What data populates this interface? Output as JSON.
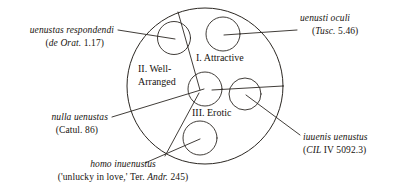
{
  "figure": {
    "kind": "labelled-venn-circle-diagram",
    "background": "#ffffff",
    "stroke_color": "#2b2722"
  },
  "zones": [
    {
      "id": "zone-1",
      "label": "I. Attractive",
      "lines": [
        "I. Attractive"
      ]
    },
    {
      "id": "zone-2",
      "label": "II. Well-Arranged",
      "lines": [
        "II. Well-",
        "Arranged"
      ]
    },
    {
      "id": "zone-3",
      "label": "III. Erotic",
      "lines": [
        "III. Erotic"
      ]
    }
  ],
  "callouts": [
    {
      "id": "callout-uenustas-respondendi",
      "term": "uenustas respondendi",
      "citation": "(de Orat. 1.17)",
      "citation_italic": "de Orat.",
      "citation_roman": "1.17",
      "position": "top-left"
    },
    {
      "id": "callout-uenusti-oculi",
      "term": "uenusti oculi",
      "citation": "(Tusc. 5.46)",
      "citation_italic": "Tusc.",
      "citation_roman": "5.46",
      "position": "top-right"
    },
    {
      "id": "callout-nulla-uenustas",
      "term": "nulla uenustas",
      "citation": "(Catul. 86)",
      "citation_italic": "",
      "citation_roman": "Catul. 86",
      "position": "middle-left"
    },
    {
      "id": "callout-iuuenis-uenustus",
      "term": "iuuenis uenustus",
      "citation": "(CIL IV 5092.3)",
      "citation_italic": "CIL",
      "citation_roman": "IV 5092.3",
      "position": "bottom-right"
    },
    {
      "id": "callout-homo-inuenustus",
      "term": "homo inuenustus",
      "citation": "('unlucky in love,' Ter. Andr. 245)",
      "citation_pre": "('unlucky in love,' Ter. ",
      "citation_italic": "Andr.",
      "citation_roman": " 245)",
      "position": "bottom-left"
    }
  ]
}
